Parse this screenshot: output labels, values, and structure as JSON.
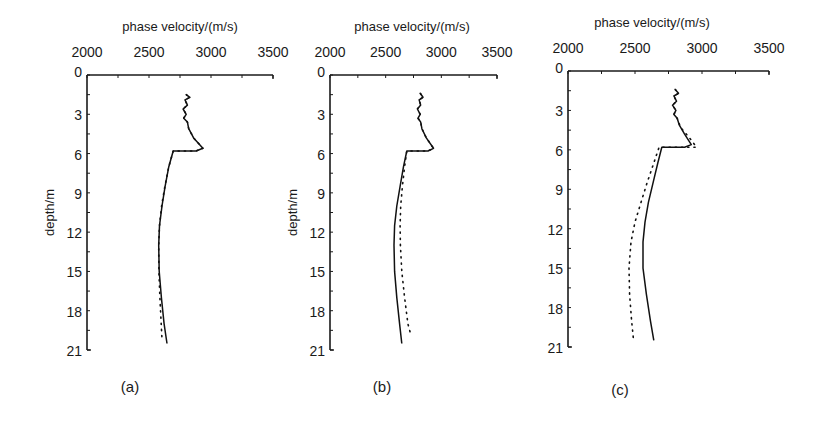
{
  "chart_data": [
    {
      "type": "line",
      "panel_label": "(a)",
      "xlabel": "phase velocity/(m/s)",
      "ylabel": "depth/m",
      "xlim": [
        2000,
        3500
      ],
      "ylim": [
        0,
        21
      ],
      "y_inverted": true,
      "x_axis_position": "top",
      "xticks": [
        2000,
        2500,
        3000,
        3500
      ],
      "yticks": [
        0,
        3,
        6,
        9,
        12,
        15,
        18,
        21
      ],
      "grid": false,
      "legend": null,
      "series": [
        {
          "name": "solid",
          "style": "solid",
          "points": [
            [
              2800,
              1.5
            ],
            [
              2830,
              1.7
            ],
            [
              2790,
              1.9
            ],
            [
              2810,
              2.3
            ],
            [
              2775,
              2.6
            ],
            [
              2800,
              3.0
            ],
            [
              2780,
              3.3
            ],
            [
              2810,
              3.6
            ],
            [
              2820,
              4.1
            ],
            [
              2860,
              4.8
            ],
            [
              2935,
              5.6
            ],
            [
              2880,
              5.8
            ],
            [
              2695,
              5.8
            ],
            [
              2660,
              7.0
            ],
            [
              2630,
              8.5
            ],
            [
              2605,
              10.0
            ],
            [
              2585,
              11.5
            ],
            [
              2578,
              13.0
            ],
            [
              2582,
              15.0
            ],
            [
              2600,
              17.0
            ],
            [
              2622,
              19.0
            ],
            [
              2645,
              20.5
            ]
          ]
        },
        {
          "name": "dotted",
          "style": "dotted",
          "points": [
            [
              2800,
              1.5
            ],
            [
              2830,
              1.7
            ],
            [
              2790,
              1.9
            ],
            [
              2810,
              2.3
            ],
            [
              2775,
              2.6
            ],
            [
              2800,
              3.0
            ],
            [
              2780,
              3.3
            ],
            [
              2810,
              3.6
            ],
            [
              2820,
              4.1
            ],
            [
              2860,
              4.8
            ],
            [
              2935,
              5.6
            ],
            [
              2880,
              5.8
            ],
            [
              2695,
              5.8
            ],
            [
              2660,
              7.0
            ],
            [
              2628,
              8.5
            ],
            [
              2602,
              10.0
            ],
            [
              2585,
              11.5
            ],
            [
              2578,
              13.0
            ],
            [
              2580,
              15.0
            ],
            [
              2588,
              17.0
            ],
            [
              2598,
              19.0
            ],
            [
              2605,
              20.2
            ]
          ]
        }
      ]
    },
    {
      "type": "line",
      "panel_label": "(b)",
      "xlabel": "phase velocity/(m/s)",
      "ylabel": "depth/m",
      "xlim": [
        2000,
        3500
      ],
      "ylim": [
        0,
        21
      ],
      "y_inverted": true,
      "x_axis_position": "top",
      "xticks": [
        2000,
        2500,
        3000,
        3500
      ],
      "yticks": [
        0,
        3,
        6,
        9,
        12,
        15,
        18,
        21
      ],
      "grid": false,
      "legend": null,
      "series": [
        {
          "name": "solid",
          "style": "solid",
          "points": [
            [
              2810,
              1.4
            ],
            [
              2835,
              1.7
            ],
            [
              2800,
              1.9
            ],
            [
              2815,
              2.3
            ],
            [
              2785,
              2.6
            ],
            [
              2810,
              3.0
            ],
            [
              2790,
              3.3
            ],
            [
              2815,
              3.6
            ],
            [
              2825,
              4.1
            ],
            [
              2865,
              4.8
            ],
            [
              2930,
              5.6
            ],
            [
              2880,
              5.8
            ],
            [
              2690,
              5.8
            ],
            [
              2660,
              7.0
            ],
            [
              2630,
              8.5
            ],
            [
              2600,
              10.0
            ],
            [
              2580,
              11.5
            ],
            [
              2575,
              13.0
            ],
            [
              2580,
              15.0
            ],
            [
              2600,
              17.0
            ],
            [
              2625,
              19.0
            ],
            [
              2645,
              20.5
            ]
          ]
        },
        {
          "name": "dotted",
          "style": "dotted",
          "points": [
            [
              2810,
              1.4
            ],
            [
              2835,
              1.7
            ],
            [
              2800,
              1.9
            ],
            [
              2815,
              2.3
            ],
            [
              2785,
              2.6
            ],
            [
              2810,
              3.0
            ],
            [
              2790,
              3.3
            ],
            [
              2815,
              3.6
            ],
            [
              2825,
              4.1
            ],
            [
              2865,
              4.8
            ],
            [
              2930,
              5.6
            ],
            [
              2880,
              5.8
            ],
            [
              2690,
              5.8
            ],
            [
              2670,
              7.0
            ],
            [
              2650,
              8.5
            ],
            [
              2635,
              10.0
            ],
            [
              2630,
              11.5
            ],
            [
              2632,
              13.0
            ],
            [
              2645,
              15.0
            ],
            [
              2670,
              17.0
            ],
            [
              2700,
              19.0
            ],
            [
              2725,
              19.8
            ]
          ]
        }
      ]
    },
    {
      "type": "line",
      "panel_label": "(c)",
      "xlabel": "phase velocity/(m/s)",
      "ylabel": "depth/m",
      "xlim": [
        2000,
        3500
      ],
      "ylim": [
        0,
        21
      ],
      "y_inverted": true,
      "x_axis_position": "top",
      "xticks": [
        2000,
        2500,
        3000,
        3500
      ],
      "yticks": [
        0,
        3,
        6,
        9,
        12,
        15,
        18,
        21
      ],
      "grid": false,
      "legend": null,
      "series": [
        {
          "name": "solid",
          "style": "solid",
          "points": [
            [
              2800,
              1.4
            ],
            [
              2825,
              1.7
            ],
            [
              2790,
              1.9
            ],
            [
              2810,
              2.3
            ],
            [
              2780,
              2.6
            ],
            [
              2805,
              3.0
            ],
            [
              2790,
              3.3
            ],
            [
              2815,
              3.6
            ],
            [
              2830,
              4.1
            ],
            [
              2870,
              4.8
            ],
            [
              2920,
              5.6
            ],
            [
              2870,
              5.8
            ],
            [
              2700,
              5.8
            ],
            [
              2670,
              7.0
            ],
            [
              2635,
              8.5
            ],
            [
              2600,
              10.0
            ],
            [
              2575,
              11.5
            ],
            [
              2560,
              13.0
            ],
            [
              2560,
              15.0
            ],
            [
              2585,
              17.0
            ],
            [
              2615,
              19.0
            ],
            [
              2640,
              20.5
            ]
          ]
        },
        {
          "name": "dotted",
          "style": "dotted",
          "points": [
            [
              2800,
              1.4
            ],
            [
              2825,
              1.7
            ],
            [
              2790,
              1.9
            ],
            [
              2810,
              2.3
            ],
            [
              2780,
              2.6
            ],
            [
              2805,
              3.0
            ],
            [
              2790,
              3.3
            ],
            [
              2815,
              3.6
            ],
            [
              2840,
              4.3
            ],
            [
              2900,
              5.0
            ],
            [
              2960,
              5.8
            ],
            [
              2870,
              5.8
            ],
            [
              2680,
              5.8
            ],
            [
              2640,
              7.0
            ],
            [
              2590,
              8.5
            ],
            [
              2545,
              10.0
            ],
            [
              2500,
              11.5
            ],
            [
              2470,
              13.0
            ],
            [
              2455,
              15.0
            ],
            [
              2460,
              17.0
            ],
            [
              2475,
              19.0
            ],
            [
              2490,
              20.6
            ]
          ]
        }
      ]
    }
  ],
  "figure": {
    "panels": [
      {
        "label": "(a)",
        "xlabel": "phase velocity/(m/s)",
        "ylabel": "depth/m"
      },
      {
        "label": "(b)",
        "xlabel": "phase velocity/(m/s)",
        "ylabel": ""
      },
      {
        "label": "(c)",
        "xlabel": "phase velocity/(m/s)",
        "ylabel": ""
      }
    ],
    "xtick_labels": [
      "2000",
      "2500",
      "3000",
      "3500"
    ],
    "ytick_labels": [
      "0",
      "3",
      "6",
      "9",
      "12",
      "15",
      "18",
      "21"
    ]
  }
}
